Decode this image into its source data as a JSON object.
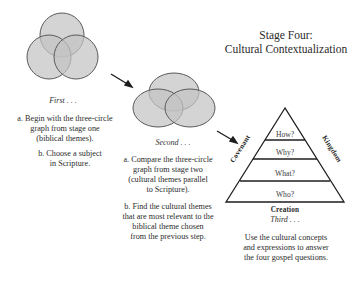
{
  "title": {
    "line1": "Stage Four:",
    "line2": "Cultural Contextualization"
  },
  "steps": {
    "first": {
      "caption": "First . . .",
      "a": [
        "a. Begin with the three-circle",
        "graph from stage one",
        "(biblical themes)."
      ],
      "b": [
        "b. Choose a subject",
        "in Scripture."
      ]
    },
    "second": {
      "caption": "Second . . .",
      "a": [
        "a. Compare the three-circle",
        "graph from stage two",
        "(cultural themes parallel",
        "to Scripture)."
      ],
      "b": [
        "b. Find the cultural themes",
        "that are most relevant to the",
        "biblical theme chosen",
        "from the previous step."
      ]
    },
    "third": {
      "caption": "Third . . .",
      "text": [
        "Use the cultural concepts",
        "and expressions to answer",
        "the four gospel questions."
      ]
    }
  },
  "pyramid": {
    "levels": [
      "How?",
      "Why?",
      "What?",
      "Who?"
    ],
    "left_label": "Covenant",
    "right_label": "Kingdom",
    "base_label": "Creation"
  },
  "colors": {
    "circle_fill": "#c2c2c2",
    "circle_stroke": "#555555",
    "line": "#1e1e1e"
  }
}
